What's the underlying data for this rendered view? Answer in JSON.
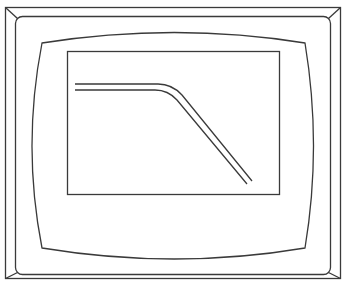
{
  "diagram": {
    "stroke_color": "#3a3a3a",
    "background_color": "#ffffff",
    "components": [
      "outer-frame",
      "inner-frame",
      "screen-bezel",
      "display-window",
      "response-curve"
    ],
    "curve_description": "flat plateau followed by a smooth bend into a linear downward slope (double line)"
  }
}
